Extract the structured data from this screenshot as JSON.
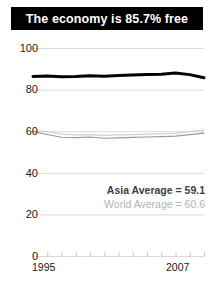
{
  "title": {
    "text": "The economy is 85.7% free"
  },
  "legend": {
    "asia": "Asia Average = 59.1",
    "world": "World Average = 60.6"
  },
  "colors": {
    "title_bar_bg": "#000000",
    "title_text": "#ffffff",
    "economy_line": "#000000",
    "asia_line": "#9a9a9a",
    "world_line": "#cfcfcf",
    "gridline": "#d9d9d9",
    "axis_text": "#1a1a1a",
    "legend_asia_text": "#3d3d3d",
    "legend_world_text": "#b3b3b3"
  },
  "chart_data": {
    "type": "line",
    "title": "The economy is 85.7% free",
    "xlabel": "",
    "ylabel": "",
    "x": [
      1995,
      1996,
      1997,
      1998,
      1999,
      2000,
      2001,
      2002,
      2003,
      2004,
      2005,
      2006,
      2007
    ],
    "xlim": [
      1995,
      2007
    ],
    "ylim": [
      0,
      100
    ],
    "yticks": [
      0,
      20,
      40,
      60,
      80,
      100
    ],
    "xticks": [
      1995,
      2007
    ],
    "xtick_labels": [
      "1995",
      "2007"
    ],
    "ytick_labels": [
      "0",
      "20",
      "40",
      "60",
      "80",
      "100"
    ],
    "grid": true,
    "legend_position": "inside-right",
    "series": [
      {
        "name": "Economy",
        "color": "#000000",
        "width": 3,
        "values": [
          86.3,
          86.5,
          86.2,
          86.3,
          86.6,
          86.4,
          86.8,
          87.0,
          87.2,
          87.4,
          88.0,
          87.2,
          85.7
        ]
      },
      {
        "name": "Asia Average",
        "color": "#9a9a9a",
        "width": 1.2,
        "value_label": 59.1,
        "values": [
          59.8,
          58.4,
          57.1,
          56.9,
          57.2,
          56.6,
          56.8,
          57.0,
          57.2,
          57.4,
          57.6,
          58.4,
          59.1
        ]
      },
      {
        "name": "World Average",
        "color": "#cfcfcf",
        "width": 1.2,
        "value_label": 60.6,
        "values": [
          60.2,
          59.9,
          58.6,
          58.2,
          58.4,
          58.0,
          58.2,
          58.4,
          58.6,
          58.8,
          59.0,
          59.8,
          60.6
        ]
      }
    ],
    "annotations": [
      "Asia Average = 59.1",
      "World Average = 60.6"
    ]
  }
}
